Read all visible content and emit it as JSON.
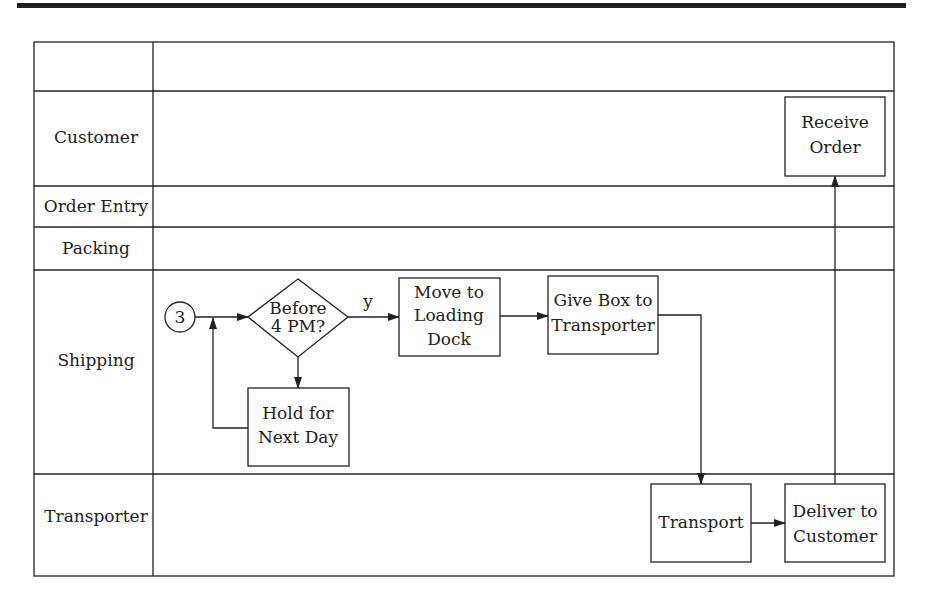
{
  "diagram": {
    "type": "swimlane-flowchart",
    "lanes": [
      {
        "id": "header",
        "label": ""
      },
      {
        "id": "customer",
        "label": "Customer"
      },
      {
        "id": "order-entry",
        "label": "Order Entry"
      },
      {
        "id": "packing",
        "label": "Packing"
      },
      {
        "id": "shipping",
        "label": "Shipping"
      },
      {
        "id": "transporter",
        "label": "Transporter"
      }
    ],
    "nodes": {
      "connector": {
        "label": "3",
        "shape": "circle",
        "lane": "shipping"
      },
      "decision": {
        "lines": [
          "Before",
          "4 PM?"
        ],
        "shape": "diamond",
        "lane": "shipping"
      },
      "hold": {
        "lines": [
          "Hold for",
          "Next Day"
        ],
        "shape": "rect",
        "lane": "shipping"
      },
      "move": {
        "lines": [
          "Move to",
          "Loading",
          "Dock"
        ],
        "shape": "rect",
        "lane": "shipping"
      },
      "give": {
        "lines": [
          "Give Box to",
          "Transporter"
        ],
        "shape": "rect",
        "lane": "shipping"
      },
      "transport": {
        "lines": [
          "Transport"
        ],
        "shape": "rect",
        "lane": "transporter"
      },
      "deliver": {
        "lines": [
          "Deliver to",
          "Customer"
        ],
        "shape": "rect",
        "lane": "transporter"
      },
      "receive": {
        "lines": [
          "Receive",
          "Order"
        ],
        "shape": "rect",
        "lane": "customer"
      }
    },
    "edges": [
      {
        "from": "connector",
        "to": "decision",
        "label": ""
      },
      {
        "from": "decision",
        "to": "move",
        "label": "y"
      },
      {
        "from": "decision",
        "to": "hold",
        "label": ""
      },
      {
        "from": "hold",
        "to": "decision",
        "label": ""
      },
      {
        "from": "move",
        "to": "give",
        "label": ""
      },
      {
        "from": "give",
        "to": "transport",
        "label": ""
      },
      {
        "from": "transport",
        "to": "deliver",
        "label": ""
      },
      {
        "from": "deliver",
        "to": "receive",
        "label": ""
      }
    ],
    "yes_label": "y"
  }
}
